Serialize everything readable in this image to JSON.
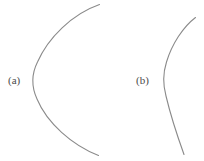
{
  "figure": {
    "width": 204,
    "height": 161,
    "background_color": "#ffffff",
    "stroke_color": "#8a8a8a",
    "stroke_width": 1.1,
    "label_color": "#4a4a4a"
  },
  "panels": [
    {
      "id": "a",
      "label": "(a)",
      "label_x": 8,
      "label_y": 74,
      "curve_name": "wide-arc",
      "path": "M 99.5 4.5 C 72 14 48 38 37.5 62 C 31.5 74 31.5 87 37 99 C 47 123 72 145 98.5 155.5"
    },
    {
      "id": "b",
      "label": "(b)",
      "label_x": 136,
      "label_y": 74,
      "curve_name": "narrow-arc",
      "path": "M 195.5 17.5 C 183 27 172 44 166.5 62 C 163 73 163 85 166 96 C 170.5 115 177 135 184 154.5"
    }
  ]
}
